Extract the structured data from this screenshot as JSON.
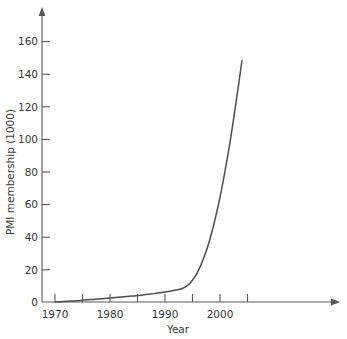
{
  "chart_data": {
    "type": "line",
    "title": "",
    "xlabel": "Year",
    "ylabel": "PMI membership (1000)",
    "xlim": [
      1968,
      2020
    ],
    "ylim": [
      0,
      172
    ],
    "grid": false,
    "legend": "none",
    "line_color": "#4d4d4d",
    "axis_color": "#585858",
    "background_color": "#ffffff",
    "x_major_ticks": [
      1970,
      1980,
      1990,
      2000
    ],
    "x_minor_ticks": [
      1975,
      1985,
      1995,
      2005
    ],
    "x_tick_labels": [
      "1970",
      "1980",
      "1990",
      "2000"
    ],
    "y_ticks": [
      0,
      20,
      40,
      60,
      80,
      100,
      120,
      140,
      160
    ],
    "y_tick_labels": [
      "0",
      "20",
      "40",
      "60",
      "80",
      "100",
      "120",
      "140",
      "160"
    ],
    "series": [
      {
        "name": "PMI membership",
        "x": [
          1970,
          1971,
          1972,
          1973,
          1974,
          1975,
          1976,
          1977,
          1978,
          1979,
          1980,
          1981,
          1982,
          1983,
          1984,
          1985,
          1986,
          1987,
          1988,
          1989,
          1990,
          1991,
          1992,
          1993,
          1994,
          1995,
          1996,
          1997,
          1998,
          1999,
          2000,
          2001,
          2002,
          2003,
          2004
        ],
        "y": [
          0.0,
          0.2,
          0.4,
          0.6,
          0.8,
          1.1,
          1.4,
          1.6,
          1.9,
          2.2,
          2.5,
          2.8,
          3.1,
          3.4,
          3.7,
          4.0,
          4.4,
          4.8,
          5.2,
          5.7,
          6.2,
          6.8,
          7.4,
          8.2,
          10.0,
          13.5,
          19.0,
          27.0,
          37.0,
          50.0,
          65.0,
          83.0,
          103.0,
          126.0,
          150.0
        ]
      }
    ]
  },
  "axis_labels": {
    "y_title": "PMI membership (1000)",
    "x_title": "Year"
  }
}
